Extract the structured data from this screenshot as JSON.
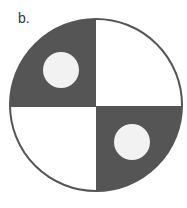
{
  "figure": {
    "label": "b.",
    "colors": {
      "dark_quadrant": "#555555",
      "light_quadrant": "#ffffff",
      "inner_circle": "#f2f2f2",
      "outline": "#555555"
    },
    "outer_circle": {
      "cx": 96,
      "cy": 105,
      "r": 86
    },
    "quadrants": [
      {
        "position": "top-left",
        "fill": "dark"
      },
      {
        "position": "top-right",
        "fill": "light"
      },
      {
        "position": "bottom-left",
        "fill": "light"
      },
      {
        "position": "bottom-right",
        "fill": "dark"
      }
    ],
    "inner_circles": [
      {
        "position": "top-left",
        "cx": 61,
        "cy": 70,
        "r": 18
      },
      {
        "position": "bottom-right",
        "cx": 132,
        "cy": 142,
        "r": 18
      }
    ]
  }
}
